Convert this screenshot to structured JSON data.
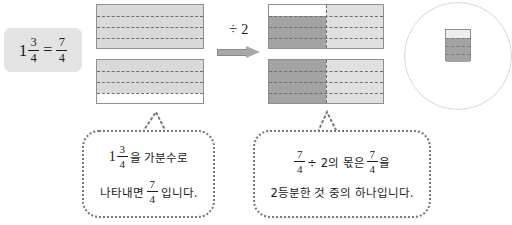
{
  "equation": {
    "whole": "1",
    "numerator": "3",
    "denominator": "4",
    "equals": "=",
    "right_numerator": "7",
    "right_denominator": "4"
  },
  "operator": {
    "label": "÷ 2",
    "arrow": "right-arrow"
  },
  "left_diagram": {
    "name": "one-and-three-quarters-model",
    "bars": [
      {
        "rows": 4,
        "shaded_rows": 4,
        "split": false
      },
      {
        "rows": 4,
        "shaded_rows": 3,
        "split": false
      }
    ],
    "fill_color": "#d9d9d9",
    "empty_color": "#ffffff",
    "border_color": "#8f8f8f"
  },
  "right_diagram": {
    "name": "divided-by-two-model",
    "bars": [
      {
        "rows": 4,
        "shaded_rows": 3,
        "split": true
      },
      {
        "rows": 4,
        "shaded_rows": 4,
        "split": true
      }
    ],
    "left_half_color": "#a3a3a3",
    "right_half_color": "#e0e0e0",
    "empty_color": "#ffffff",
    "border_color": "#8f8f8f"
  },
  "left_bubble": {
    "line1": {
      "whole": "1",
      "numerator": "3",
      "denominator": "4",
      "text": "을 가분수로"
    },
    "line2": {
      "pre": "나타내면",
      "numerator": "7",
      "denominator": "4",
      "post": "입니다."
    }
  },
  "right_bubble": {
    "line1": {
      "numerator": "7",
      "denominator": "4",
      "mid": "÷ 2의 몫은",
      "numerator2": "7",
      "denominator2": "4",
      "post": "을"
    },
    "line2": {
      "text": "2등분한 것 중의 하나입니다."
    }
  },
  "magnifier": {
    "name": "magnifier-callout",
    "mini": {
      "rows": 4,
      "shaded_rows": 3
    }
  }
}
